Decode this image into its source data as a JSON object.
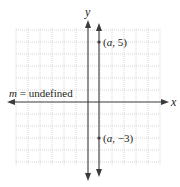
{
  "figure": {
    "type": "coordinate-plane",
    "axes": {
      "x_label": "x",
      "y_label": "y"
    },
    "annotation": {
      "slope_var": "m",
      "equals": " = ",
      "slope_value": "undefined"
    },
    "line": {
      "kind": "vertical",
      "x": "a"
    },
    "points": [
      {
        "label_open": "(",
        "var": "a",
        "sep": ", ",
        "val": "5",
        "label_close": ")"
      },
      {
        "label_open": "(",
        "var": "a",
        "sep": ", ",
        "val": "−3",
        "label_close": ")"
      }
    ],
    "colors": {
      "grid": "#b8b8b8",
      "axis": "#3a3a3a",
      "line": "#3a3a3a",
      "text": "#231f20"
    }
  }
}
